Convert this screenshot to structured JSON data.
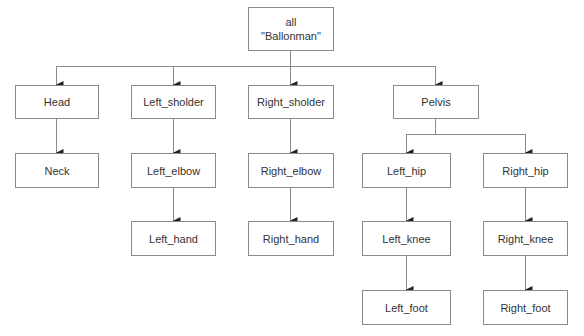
{
  "diagram": {
    "type": "tree",
    "root": {
      "line1": "all",
      "line2": "\"Ballonman\""
    },
    "nodes": {
      "head": "Head",
      "neck": "Neck",
      "left_sholder": "Left_sholder",
      "left_elbow": "Left_elbow",
      "left_hand": "Left_hand",
      "right_sholder": "Right_sholder",
      "right_elbow": "Right_elbow",
      "right_hand": "Right_hand",
      "pelvis": "Pelvis",
      "left_hip": "Left_hip",
      "left_knee": "Left_knee",
      "left_foot": "Left_foot",
      "right_hip": "Right_hip",
      "right_knee": "Right_knee",
      "right_foot": "Right_foot"
    },
    "edges": [
      [
        "all",
        "Head"
      ],
      [
        "all",
        "Left_sholder"
      ],
      [
        "all",
        "Right_sholder"
      ],
      [
        "all",
        "Pelvis"
      ],
      [
        "Head",
        "Neck"
      ],
      [
        "Left_sholder",
        "Left_elbow"
      ],
      [
        "Left_elbow",
        "Left_hand"
      ],
      [
        "Right_sholder",
        "Right_elbow"
      ],
      [
        "Right_elbow",
        "Right_hand"
      ],
      [
        "Pelvis",
        "Left_hip"
      ],
      [
        "Pelvis",
        "Right_hip"
      ],
      [
        "Left_hip",
        "Left_knee"
      ],
      [
        "Left_knee",
        "Left_foot"
      ],
      [
        "Right_hip",
        "Right_knee"
      ],
      [
        "Right_knee",
        "Right_foot"
      ]
    ],
    "colors": {
      "line": "#8a8a8a",
      "arrow": "#222222",
      "text": "#333333"
    }
  }
}
